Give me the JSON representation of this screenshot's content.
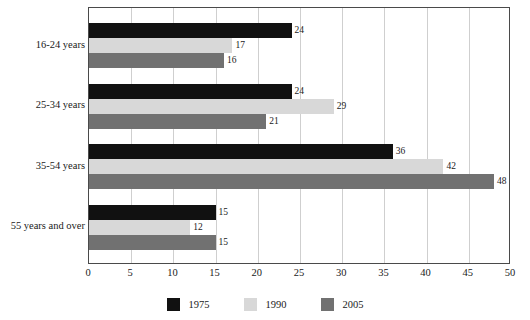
{
  "chart_data": {
    "type": "bar",
    "orientation": "horizontal",
    "title": "",
    "xlabel": "",
    "ylabel": "",
    "xlim": [
      0,
      50
    ],
    "xticks": [
      0,
      5,
      10,
      15,
      20,
      25,
      30,
      35,
      40,
      45,
      50
    ],
    "grid": true,
    "grid_axis": "x",
    "legend_position": "bottom",
    "categories": [
      "16-24 years",
      "25-34 years",
      "35-54 years",
      "55 years and over"
    ],
    "series": [
      {
        "name": "1975",
        "color": "#111111",
        "values": [
          24,
          24,
          36,
          15
        ]
      },
      {
        "name": "1990",
        "color": "#d8d8d8",
        "values": [
          17,
          29,
          42,
          12
        ]
      },
      {
        "name": "2005",
        "color": "#717171",
        "values": [
          16,
          21,
          48,
          15
        ]
      }
    ]
  },
  "legend": {
    "items": [
      {
        "label": "1975",
        "swatch": "s1975"
      },
      {
        "label": "1990",
        "swatch": "s1990"
      },
      {
        "label": "2005",
        "swatch": "s2005"
      }
    ]
  },
  "colors": {
    "series_1975": "#111111",
    "series_1990": "#d8d8d8",
    "series_2005": "#717171",
    "frame": "#4a4a4a",
    "gridline": "#cfcfcf",
    "text": "#1a1a1a",
    "background": "#ffffff"
  }
}
